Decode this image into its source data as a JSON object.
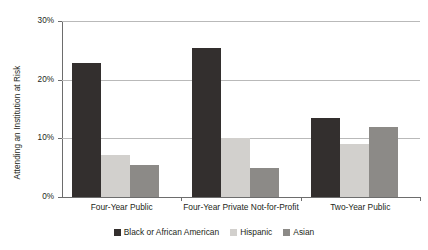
{
  "chart_data": {
    "type": "bar",
    "title": "",
    "subtitle": "",
    "xlabel": "",
    "ylabel": "Attending an Institution at Risk",
    "categories": [
      "Four-Year Public",
      "Four-Year Private Not-for-Profit",
      "Two-Year Public"
    ],
    "series": [
      {
        "name": "Black or African American",
        "color": "#332f2e",
        "values": [
          22.8,
          25.4,
          13.4
        ]
      },
      {
        "name": "Hispanic",
        "color": "#d2d0cd",
        "values": [
          7.2,
          10.0,
          9.0
        ]
      },
      {
        "name": "Asian",
        "color": "#8c8a87",
        "values": [
          5.5,
          5.0,
          11.9
        ]
      }
    ],
    "ylim": [
      0,
      30
    ],
    "yticks": [
      0,
      10,
      20,
      30
    ],
    "ytick_labels": [
      "0%",
      "10%",
      "20%",
      "30%"
    ],
    "grid": true,
    "legend_position": "bottom"
  },
  "axis": {
    "y_title": "Attending an Institution at Risk"
  }
}
